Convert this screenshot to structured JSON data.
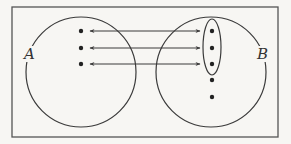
{
  "diagram": {
    "type": "set-mapping",
    "background": "#f7f6f3",
    "stroke": "#3a3a3a",
    "frame": {
      "x": 12,
      "y": 7,
      "w": 266,
      "h": 130
    },
    "sets": [
      {
        "label": "A",
        "cx": 81,
        "cy": 72,
        "r": 55,
        "label_x": 26,
        "label_y": 56,
        "elements": [
          {
            "x": 81,
            "y": 31
          },
          {
            "x": 81,
            "y": 48
          },
          {
            "x": 81,
            "y": 64
          }
        ]
      },
      {
        "label": "B",
        "cx": 211,
        "cy": 72,
        "r": 55,
        "label_x": 258,
        "label_y": 56,
        "elements": [
          {
            "x": 212,
            "y": 31
          },
          {
            "x": 212,
            "y": 48
          },
          {
            "x": 212,
            "y": 64
          },
          {
            "x": 212,
            "y": 80
          },
          {
            "x": 212,
            "y": 97
          }
        ]
      }
    ],
    "subset_ellipse": {
      "cx": 212,
      "cy": 47,
      "rx": 9,
      "ry": 28
    },
    "arrows": [
      {
        "x1": 90,
        "y1": 31,
        "x2": 200,
        "y2": 31,
        "bidirectional": true
      },
      {
        "x1": 90,
        "y1": 48,
        "x2": 200,
        "y2": 48,
        "bidirectional": true
      },
      {
        "x1": 90,
        "y1": 64,
        "x2": 200,
        "y2": 64,
        "bidirectional": true
      }
    ]
  }
}
